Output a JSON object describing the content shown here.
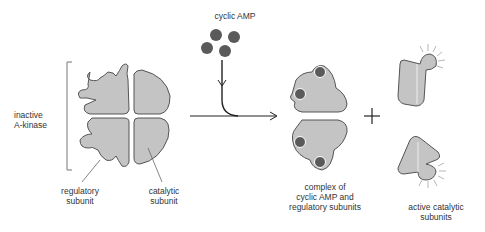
{
  "diagram": {
    "labels": {
      "cyclic_amp": "cyclic AMP",
      "inactive_line1": "inactive",
      "inactive_line2": "A-kinase",
      "regulatory_line1": "regulatory",
      "regulatory_line2": "subunit",
      "catalytic_line1": "catalytic",
      "catalytic_line2": "subunit",
      "complex_line1": "complex of",
      "complex_line2": "cyclic AMP and",
      "complex_line3": "regulatory subunits",
      "active_line1": "active catalytic",
      "active_line2": "subunits",
      "plus": "+"
    },
    "colors": {
      "subunit_fill": "#c4c4c4",
      "outline": "#555555",
      "camp": "#5a5a5a",
      "text": "#333333"
    }
  }
}
